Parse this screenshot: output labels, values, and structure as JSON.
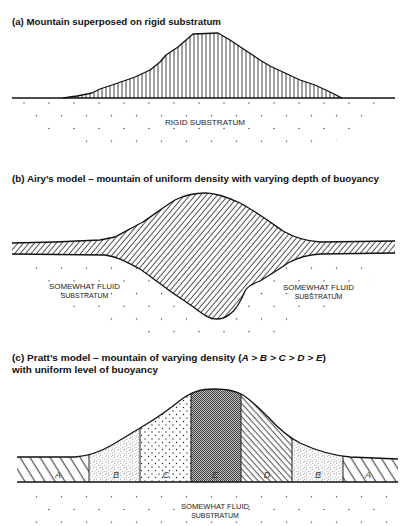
{
  "figure": {
    "panels": {
      "a": {
        "title": "(a) Mountain superposed on rigid substratum",
        "substratum_label": "RIGID SUBSTRATUM"
      },
      "b": {
        "title": "(b) Airy’s model – mountain of uniform density with varying depth of buoyancy",
        "left_label": {
          "line1": "SOMEWHAT FLUID",
          "line2": "SUBSTRATUM"
        },
        "right_label": {
          "line1": "SOMEWHAT FLUID",
          "line2": "SUBSTRATUM"
        }
      },
      "c": {
        "title_prefix": "(c) Pratt’s model – mountain of varying density (",
        "title_formula": "A > B > C > D > E",
        "title_suffix": ")",
        "title_line2": "with uniform level of buoyancy",
        "blocks": [
          "A",
          "B",
          "C",
          "E",
          "D",
          "B",
          "A"
        ],
        "substratum_label": {
          "line1": "SOMEWHAT FLUID",
          "line2": "SUBSTRATUM"
        }
      }
    },
    "colors": {
      "ink": "#111111",
      "background": "#ffffff",
      "density_E_fill": "#888888"
    }
  }
}
